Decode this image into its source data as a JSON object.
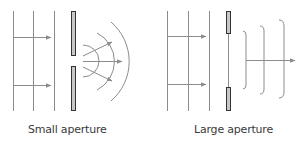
{
  "diagram": {
    "colors": {
      "line": "#8c8c8c",
      "barrier_fill": "#c8c8c8",
      "barrier_stroke": "#333333",
      "text": "#3a3a3a",
      "background": "#ffffff"
    },
    "panels": [
      {
        "id": "small",
        "caption": "Small aperture",
        "incident_wavefronts": 3,
        "diffracted_wavefronts": 3,
        "wave_shape": "circular",
        "arrows_after": 3
      },
      {
        "id": "large",
        "caption": "Large aperture",
        "incident_wavefronts": 3,
        "diffracted_wavefronts": 3,
        "wave_shape": "straight with curved edges",
        "arrows_after": 1
      }
    ]
  }
}
